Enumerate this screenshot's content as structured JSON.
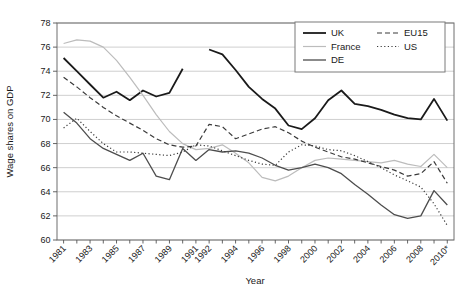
{
  "figure": {
    "background": "#ffffff",
    "axis_color": "#6e6e6e",
    "grid_color": "#c9c9c9",
    "text_color": "#1a1a1a",
    "legend_border_color": "#7a7a7a"
  },
  "chart_data": {
    "type": "line",
    "title": "",
    "xlabel": "Year",
    "ylabel": "Wage shares on GDP",
    "ylim": [
      60,
      78
    ],
    "yticks": [
      60,
      62,
      64,
      66,
      68,
      70,
      72,
      74,
      76,
      78
    ],
    "grid": "horizontal",
    "legend_position": "top-right-inside",
    "axis_break_note": "UK series has a break between 1991 and 1992; both 1991 and 1992 carry axis labels",
    "x_categories": [
      "1981",
      "1982",
      "1983",
      "1984",
      "1985",
      "1986",
      "1987",
      "1988",
      "1989",
      "1990",
      "1991",
      "1992",
      "1993",
      "1994",
      "1995",
      "1996",
      "1997",
      "1998",
      "1999",
      "2000",
      "2001",
      "2002",
      "2003",
      "2004",
      "2005",
      "2006",
      "2007",
      "2008",
      "2009",
      "2010"
    ],
    "xticks": [
      {
        "index": 0,
        "label": "1981"
      },
      {
        "index": 2,
        "label": "1983"
      },
      {
        "index": 4,
        "label": "1985"
      },
      {
        "index": 6,
        "label": "1987"
      },
      {
        "index": 8,
        "label": "1989"
      },
      {
        "index": 10,
        "label": "1991"
      },
      {
        "index": 11,
        "label": "1992"
      },
      {
        "index": 13,
        "label": "1994"
      },
      {
        "index": 15,
        "label": "1996"
      },
      {
        "index": 17,
        "label": "1998"
      },
      {
        "index": 19,
        "label": "2000"
      },
      {
        "index": 21,
        "label": "2002"
      },
      {
        "index": 23,
        "label": "2004"
      },
      {
        "index": 25,
        "label": "2006"
      },
      {
        "index": 27,
        "label": "2008"
      },
      {
        "index": 29,
        "label": "2010*"
      }
    ],
    "series": [
      {
        "name": "UK",
        "style": "solid",
        "color": "#1a1a1a",
        "width": 1.8,
        "values": [
          75.1,
          74.0,
          72.9,
          71.8,
          72.3,
          71.6,
          72.4,
          71.9,
          72.2,
          74.2,
          null,
          75.8,
          75.4,
          74.1,
          72.7,
          71.7,
          70.9,
          69.5,
          69.2,
          70.1,
          71.6,
          72.4,
          71.3,
          71.1,
          70.8,
          70.4,
          70.1,
          70.0,
          71.7,
          69.9
        ]
      },
      {
        "name": "France",
        "style": "solid",
        "color": "#bcbcbc",
        "width": 1.2,
        "values": [
          76.3,
          76.6,
          76.5,
          76.0,
          74.9,
          73.5,
          72.0,
          70.4,
          69.0,
          68.0,
          67.5,
          67.6,
          67.9,
          67.2,
          66.4,
          65.2,
          64.9,
          65.3,
          66.0,
          66.6,
          66.8,
          66.7,
          66.6,
          66.5,
          66.4,
          66.6,
          66.3,
          66.1,
          67.1,
          66.0
        ]
      },
      {
        "name": "DE",
        "style": "solid",
        "color": "#4d4d4d",
        "width": 1.3,
        "values": [
          70.6,
          69.7,
          68.4,
          67.6,
          67.1,
          66.6,
          67.2,
          65.3,
          65.0,
          67.6,
          66.6,
          67.5,
          67.3,
          67.4,
          67.2,
          66.8,
          66.2,
          65.8,
          66.0,
          66.3,
          66.0,
          65.5,
          64.6,
          63.8,
          62.9,
          62.1,
          61.8,
          62.0,
          64.1,
          62.9
        ]
      },
      {
        "name": "EU15",
        "style": "dashed",
        "color": "#3a3a3a",
        "width": 1.2,
        "values": [
          73.5,
          72.7,
          71.8,
          71.0,
          70.3,
          69.7,
          69.1,
          68.4,
          67.9,
          67.7,
          67.8,
          69.6,
          69.4,
          68.4,
          68.8,
          69.2,
          69.4,
          68.9,
          68.2,
          67.7,
          67.3,
          66.9,
          66.7,
          66.4,
          66.1,
          65.8,
          65.3,
          65.5,
          66.5,
          64.7
        ]
      },
      {
        "name": "US",
        "style": "dotted",
        "color": "#3a3a3a",
        "width": 1.2,
        "values": [
          69.3,
          70.1,
          69.0,
          68.0,
          67.3,
          67.3,
          67.2,
          67.1,
          67.0,
          67.3,
          67.9,
          67.8,
          67.4,
          67.0,
          66.6,
          66.3,
          66.2,
          67.3,
          67.9,
          67.8,
          67.5,
          67.4,
          67.0,
          66.5,
          66.0,
          65.4,
          64.9,
          64.4,
          63.0,
          61.2
        ]
      }
    ]
  },
  "legend": {
    "columns": [
      [
        "UK",
        "France",
        "DE"
      ],
      [
        "EU15",
        "US"
      ]
    ]
  }
}
